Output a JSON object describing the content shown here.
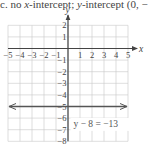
{
  "caption": {
    "prefix": "c. no ",
    "x_var": "x",
    "middle": "-intercept; ",
    "y_var": "y",
    "suffix": "-intercept (0, −"
  },
  "chart_data": {
    "type": "line",
    "title": "",
    "xlabel": "x",
    "ylabel": "y",
    "xlim": [
      -5,
      5
    ],
    "ylim": [
      -8,
      2
    ],
    "grid": true,
    "x_ticks": [
      -5,
      -4,
      -3,
      -2,
      -1,
      1,
      2,
      3,
      4,
      5
    ],
    "y_ticks": [
      2,
      1,
      -1,
      -2,
      -3,
      -4,
      -5,
      -6,
      -7,
      -8
    ],
    "x_tick_labels": [
      "−5",
      "−4",
      "−3",
      "−2",
      "−1",
      "1",
      "2",
      "3",
      "4",
      "5"
    ],
    "y_tick_labels": [
      "2",
      "1",
      "−1",
      "−2",
      "−3",
      "−4",
      "−5",
      "−6",
      "−7",
      "−8"
    ],
    "series": [
      {
        "name": "y - 8 = -13",
        "type": "horizontal-line",
        "y": -5,
        "x": [
          -5,
          5
        ],
        "arrows": "both",
        "color": "#555555"
      }
    ],
    "annotations": [
      {
        "text": "y − 8 = −13",
        "x": 0.5,
        "y": -6.5
      }
    ]
  }
}
